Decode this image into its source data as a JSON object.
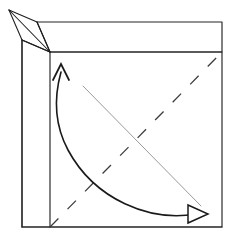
{
  "diagram": {
    "type": "origami-fold-step",
    "canvas": {
      "width": 231,
      "height": 249,
      "background": "#ffffff"
    },
    "colors": {
      "edge": "#242424",
      "flap": "#1d1d1d",
      "crease_dashed": "#3a3a3a",
      "crease_thin": "#9a9a9a",
      "arrow": "#1a1a1a",
      "arrow_fill": "#ffffff"
    },
    "shapes": {
      "sheet_outline": {
        "name": "main-sheet",
        "points": "50,52 222,52 222,227 22,227 22,40"
      },
      "sheet_top_band": {
        "name": "top-band",
        "points": "37,22 222,22 222,52 50,52"
      },
      "inner_vertical": {
        "name": "inner-vertical-edge",
        "x1": 50,
        "y1": 52,
        "x2": 50,
        "y2": 227
      },
      "left_vertical": {
        "name": "left-outer-edge",
        "x1": 22,
        "y1": 40,
        "x2": 22,
        "y2": 227
      },
      "flap_lines": [
        {
          "name": "flap-apex-to-top-band",
          "x1": 9,
          "y1": 10,
          "x2": 37,
          "y2": 22
        },
        {
          "name": "flap-apex-to-corner",
          "x1": 9,
          "y1": 10,
          "x2": 50,
          "y2": 52
        },
        {
          "name": "flap-apex-to-left-edge",
          "x1": 9,
          "y1": 10,
          "x2": 22,
          "y2": 40
        },
        {
          "name": "flap-left-edge-to-corner",
          "x1": 22,
          "y1": 40,
          "x2": 50,
          "y2": 52
        },
        {
          "name": "flap-topband-to-corner",
          "x1": 37,
          "y1": 22,
          "x2": 50,
          "y2": 52
        }
      ],
      "dashed_crease": {
        "name": "diagonal-crease",
        "x1": 50,
        "y1": 227,
        "x2": 222,
        "y2": 52,
        "dash": "12 13"
      },
      "thin_crease": {
        "name": "thin-diagonal-crease",
        "x1": 83,
        "y1": 86,
        "x2": 201,
        "y2": 206
      },
      "fold_arrow": {
        "name": "fold-direction-arrow",
        "path": "M 196,214 C 150,222 95,200 68,150 C 52,120 56,90 61,72",
        "head_up": "53,80 61,64 69,80",
        "head_right": "188,205 208,214 188,223"
      }
    }
  }
}
